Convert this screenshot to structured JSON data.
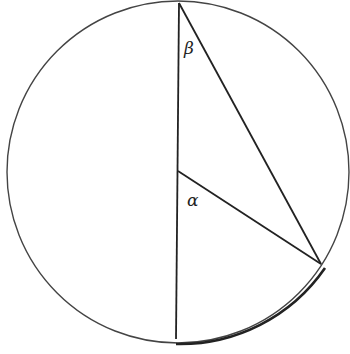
{
  "diagram": {
    "type": "geometry",
    "circle": {
      "cx": 178,
      "cy": 172,
      "r": 171
    },
    "points": {
      "top": {
        "x": 178,
        "y": 3
      },
      "center": {
        "x": 178,
        "y": 171
      },
      "bottom": {
        "x": 176,
        "y": 339
      },
      "arc_point": {
        "x": 321,
        "y": 264
      }
    },
    "labels": {
      "beta": "β",
      "alpha": "α"
    },
    "highlighted_arc": "from bottom of diameter to arc point",
    "colors": {
      "stroke": "#222222",
      "background": "#ffffff"
    }
  }
}
